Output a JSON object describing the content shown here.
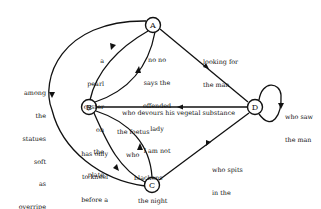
{
  "diagram": {
    "type": "directed-graph",
    "nodes": [
      {
        "id": "A",
        "label": "A"
      },
      {
        "id": "B",
        "label": "B"
      },
      {
        "id": "C",
        "label": "C"
      },
      {
        "id": "D",
        "label": "D"
      }
    ],
    "edges": {
      "a_to_c_outer": {
        "from": "A",
        "to": "C",
        "lines": [
          "among",
          "the",
          "statues",
          "soft",
          "as",
          "overripe",
          "fruits"
        ]
      },
      "a_to_b": {
        "from": "A",
        "to": "B",
        "lines": [
          "a",
          "pearl",
          "oyster",
          "on",
          "the",
          "plate"
        ]
      },
      "b_to_a": {
        "from": "B",
        "to": "A",
        "lines": [
          "no no",
          "says the",
          "offended",
          "lady",
          "I am not"
        ]
      },
      "a_to_d": {
        "from": "A",
        "to": "D",
        "lines": [
          "looking for",
          "the man"
        ]
      },
      "d_to_b": {
        "from": "D",
        "to": "B",
        "lines": [
          "who devours his vegetal substance"
        ]
      },
      "d_to_d": {
        "from": "D",
        "to": "D",
        "lines": [
          "who saw",
          "the man"
        ]
      },
      "b_to_c": {
        "from": "B",
        "to": "C",
        "lines": [
          "has only",
          "to kneel",
          "before a",
          "caterpillar"
        ]
      },
      "c_to_b": {
        "from": "C",
        "to": "B",
        "lines": [
          "the foetus",
          "who",
          "blackens",
          "the night"
        ]
      },
      "d_to_c": {
        "from": "D",
        "to": "C",
        "lines": [
          "who spits",
          "in the",
          "pitcher"
        ]
      }
    }
  }
}
